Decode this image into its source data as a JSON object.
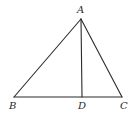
{
  "diagram": {
    "type": "geometry-triangle",
    "points": {
      "A": {
        "label": "A",
        "x": 81,
        "y": 19
      },
      "B": {
        "label": "B",
        "x": 14,
        "y": 97
      },
      "C": {
        "label": "C",
        "x": 122,
        "y": 97
      },
      "D": {
        "label": "D",
        "x": 82,
        "y": 97
      }
    },
    "segments": [
      "AB",
      "AC",
      "BC",
      "AD"
    ],
    "labels": {
      "A": "A",
      "B": "B",
      "C": "C",
      "D": "D"
    },
    "stroke_color": "#2a2a2a"
  }
}
